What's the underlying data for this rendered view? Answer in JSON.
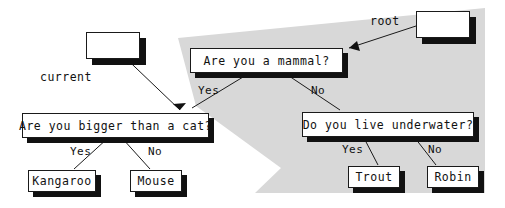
{
  "diagram": {
    "background_color": "#ffffff",
    "highlight_region_color": "#d8d8d8",
    "node_fill_color": "#ffffff",
    "node_border_color": "#1a1a1a",
    "shadow_color": "#111111",
    "annotations": [
      {
        "id": "current",
        "label": "current"
      },
      {
        "id": "root",
        "label": "root"
      }
    ],
    "blank_nodes": [
      {
        "id": "current-box",
        "label": ""
      },
      {
        "id": "root-box",
        "label": ""
      }
    ],
    "nodes": [
      {
        "id": "q-mammal",
        "label": "Are you a mammal?",
        "kind": "question"
      },
      {
        "id": "q-bigger-cat",
        "label": "Are you bigger than a cat?",
        "kind": "question"
      },
      {
        "id": "q-underwater",
        "label": "Do you live underwater?",
        "kind": "question"
      },
      {
        "id": "leaf-kangaroo",
        "label": "Kangaroo",
        "kind": "leaf"
      },
      {
        "id": "leaf-mouse",
        "label": "Mouse",
        "kind": "leaf"
      },
      {
        "id": "leaf-trout",
        "label": "Trout",
        "kind": "leaf"
      },
      {
        "id": "leaf-robin",
        "label": "Robin",
        "kind": "leaf"
      }
    ],
    "edges": [
      {
        "from": "q-mammal",
        "to": "q-bigger-cat",
        "label": "Yes"
      },
      {
        "from": "q-mammal",
        "to": "q-underwater",
        "label": "No"
      },
      {
        "from": "q-bigger-cat",
        "to": "leaf-kangaroo",
        "label": "Yes"
      },
      {
        "from": "q-bigger-cat",
        "to": "leaf-mouse",
        "label": "No"
      },
      {
        "from": "q-underwater",
        "to": "leaf-trout",
        "label": "Yes"
      },
      {
        "from": "q-underwater",
        "to": "leaf-robin",
        "label": "No"
      }
    ],
    "edge_labels": {
      "mammal_yes": "Yes",
      "mammal_no": "No",
      "bigger_yes": "Yes",
      "bigger_no": "No",
      "underwater_yes": "Yes",
      "underwater_no": "No"
    }
  }
}
